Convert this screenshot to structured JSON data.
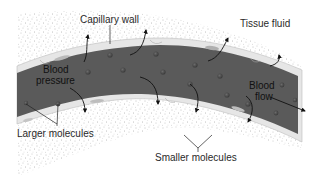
{
  "diagram": {
    "labels": {
      "capillary_wall": "Capillary wall",
      "tissue_fluid": "Tissue fluid",
      "blood_pressure_line1": "Blood",
      "blood_pressure_line2": "pressure",
      "blood_flow_line1": "Blood",
      "blood_flow_line2": "flow",
      "larger_molecules": "Larger molecules",
      "smaller_molecules": "Smaller molecules"
    },
    "colors": {
      "lumen": "#5a5a5a",
      "wall": "#e4e4e4",
      "tissue_dots": "#7a7a7a",
      "molecule": "#3c3c3c",
      "text": "#2a2a2a"
    }
  }
}
